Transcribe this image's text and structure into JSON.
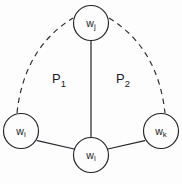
{
  "diagram": {
    "background_color": "#fdfdfd",
    "ink_color": "#24242a",
    "nodes": [
      {
        "id": "node-wj",
        "name": "node-w-j",
        "base": "w",
        "subscript": "j",
        "cx": 91,
        "cy": 23,
        "r": 17.5
      },
      {
        "id": "node-wi",
        "name": "node-w-i",
        "base": "w",
        "subscript": "i",
        "cx": 21,
        "cy": 131,
        "r": 17.5
      },
      {
        "id": "node-wl",
        "name": "node-w-l",
        "base": "w",
        "subscript": "l",
        "cx": 91,
        "cy": 155,
        "r": 17.5
      },
      {
        "id": "node-wk",
        "name": "node-w-k",
        "base": "w",
        "subscript": "k",
        "cx": 161,
        "cy": 131,
        "r": 17.5
      }
    ],
    "solid_edges": [
      {
        "id": "edge-wj-wl",
        "name": "edge-w-j-to-w-l",
        "x1": 91,
        "y1": 40.5,
        "x2": 91,
        "y2": 137.5
      },
      {
        "id": "edge-wi-wl",
        "name": "edge-w-i-to-w-l",
        "x1": 37.2,
        "y1": 140.6,
        "x2": 74.2,
        "y2": 149.0
      },
      {
        "id": "edge-wl-wk",
        "name": "edge-w-l-to-w-k",
        "x1": 107.8,
        "y1": 149.0,
        "x2": 144.8,
        "y2": 140.6
      }
    ],
    "dashed_edges": [
      {
        "id": "arc-wi-wj",
        "name": "dashed-arc-w-i-to-w-j",
        "path": "M 17 113 Q 24 48 73 18"
      },
      {
        "id": "arc-wj-wk",
        "name": "dashed-arc-w-j-to-w-k",
        "path": "M 109 18 Q 158 48 165 113"
      }
    ],
    "region_labels": [
      {
        "id": "region-p1",
        "name": "region-label-p1",
        "base": "P",
        "subscript": "1",
        "x": 59,
        "y": 80
      },
      {
        "id": "region-p2",
        "name": "region-label-p2",
        "base": "P",
        "subscript": "2",
        "x": 123,
        "y": 80
      }
    ]
  }
}
